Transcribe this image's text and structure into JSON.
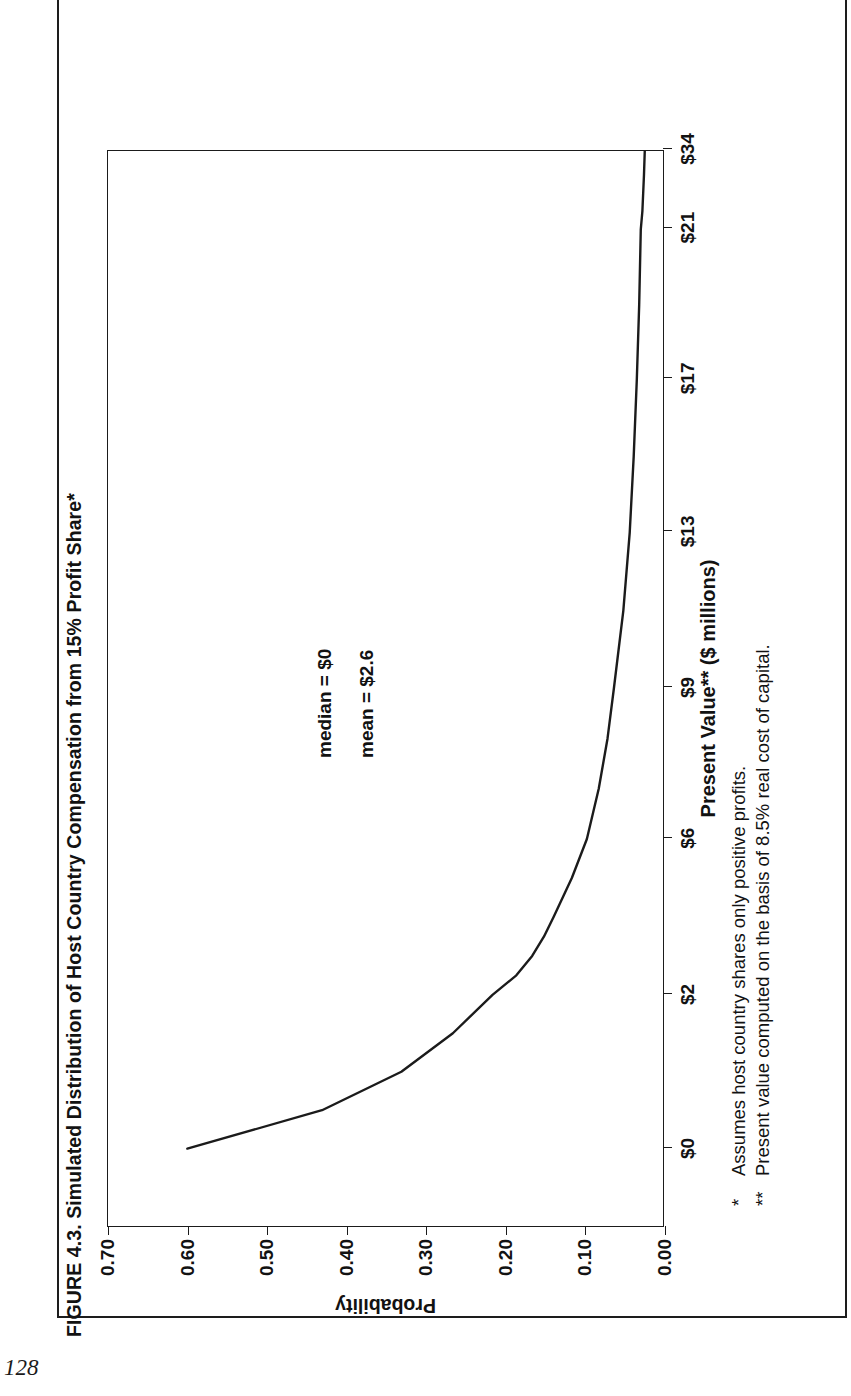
{
  "page": {
    "folio": "128"
  },
  "figure": {
    "title": "FIGURE 4.3. Simulated Distribution of Host Country Compensation from 15% Profit Share*",
    "footnotes": [
      {
        "mark": "*",
        "text": "Assumes host country shares only positive profits."
      },
      {
        "mark": "**",
        "text": "Present value computed on the basis of 8.5% real cost of capital."
      }
    ]
  },
  "chart_data": {
    "type": "line",
    "title": "FIGURE 4.3. Simulated Distribution of Host Country Compensation from 15% Profit Share*",
    "xlabel": "Present Value** ($ millions)",
    "ylabel": "Probability",
    "grid": false,
    "legend": "none",
    "x_tick_labels": [
      "$0",
      "$2",
      "$6",
      "$9",
      "$13",
      "$17",
      "$21",
      "$34"
    ],
    "x_tick_values": [
      0,
      2,
      6,
      9,
      13,
      17,
      21,
      34
    ],
    "y_tick_labels": [
      "0.00",
      "0.10",
      "0.20",
      "0.30",
      "0.40",
      "0.50",
      "0.60",
      "0.70"
    ],
    "y_tick_values": [
      0.0,
      0.1,
      0.2,
      0.3,
      0.4,
      0.5,
      0.6,
      0.7
    ],
    "xlim": [
      0,
      34
    ],
    "ylim": [
      0,
      0.7
    ],
    "series": [
      {
        "name": "Probability of host country compensation",
        "x": [
          0,
          0.5,
          1,
          1.5,
          2,
          2.5,
          3,
          3.5,
          4,
          5,
          6,
          7,
          8,
          9,
          11,
          13,
          15,
          17,
          19,
          21,
          24,
          27,
          30,
          34
        ],
        "y": [
          0.6,
          0.43,
          0.33,
          0.265,
          0.215,
          0.185,
          0.165,
          0.15,
          0.138,
          0.115,
          0.096,
          0.081,
          0.07,
          0.062,
          0.05,
          0.042,
          0.037,
          0.033,
          0.03,
          0.028,
          0.026,
          0.025,
          0.024,
          0.023
        ]
      }
    ],
    "annotations": [
      {
        "label": "median = $0",
        "x": 13.2,
        "y": 0.445
      },
      {
        "label": "mean = $2.6",
        "x": 13.2,
        "y": 0.393
      }
    ]
  }
}
